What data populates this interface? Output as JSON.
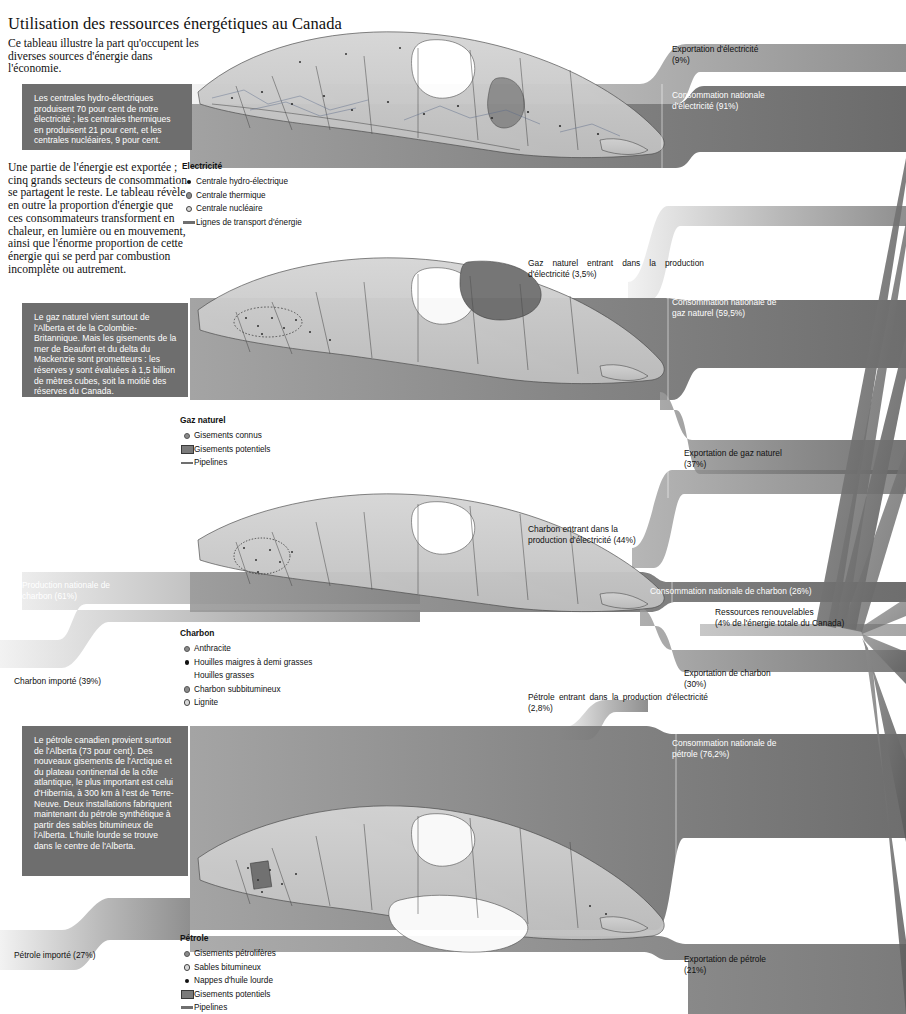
{
  "header": {
    "title": "Utilisation des ressources énergétiques au Canada",
    "intro": "Ce tableau illustre la part qu'occupent les diverses sources d'énergie dans l'économie.",
    "intro2": "Une partie de l'énergie est exportée ; cinq grands secteurs de consommation se partagent le reste. Le tableau révèle en outre la proportion d'énergie que ces consommateurs transforment en chaleur, en lumière ou en mouvement, ainsi que l'énorme proportion de cette énergie qui se perd par combustion incomplète ou autrement."
  },
  "notes": {
    "electricite": "Les centrales hydro-électriques produisent 70 pour cent de notre électricité ; les centrales thermiques en produisent 21 pour cent, et les centrales nucléaires, 9 pour cent.",
    "gaz": "Le gaz naturel vient surtout de l'Alberta et de la Colombie-Britannique. Mais les gisements de la mer de Beaufort et du delta du Mackenzie sont prometteurs : les réserves y sont évaluées à 1,5 billion de mètres cubes, soit la moitié des réserves du Canada.",
    "petrole": "Le pétrole canadien provient surtout de l'Alberta (73 pour cent). Des nouveaux gisements de l'Arctique et du plateau continental de la côte atlantique, le plus important est celui d'Hibernia, à 300 km à l'est de Terre-Neuve. Deux installations fabriquent maintenant du pétrole synthétique à partir des sables bitumineux de l'Alberta. L'huile lourde se trouve dans le centre de l'Alberta."
  },
  "legends": [
    {
      "key": "electricite",
      "title": "Electricité",
      "items": [
        {
          "marker": "dot-solid",
          "label": "Centrale hydro-électrique"
        },
        {
          "marker": "dot-mid",
          "label": "Centrale thermique"
        },
        {
          "marker": "dot-open",
          "label": "Centrale nucléaire"
        },
        {
          "marker": "line",
          "label": "Lignes de transport d'énergie"
        }
      ]
    },
    {
      "key": "gaz-naturel",
      "title": "Gaz naturel",
      "items": [
        {
          "marker": "dot-mid",
          "label": "Gisements connus"
        },
        {
          "marker": "swatch",
          "label": "Gisements potentiels"
        },
        {
          "marker": "line",
          "label": "Pipelines"
        }
      ]
    },
    {
      "key": "charbon",
      "title": "Charbon",
      "items": [
        {
          "marker": "dot-mid",
          "label": "Anthracite"
        },
        {
          "marker": "dot-solid",
          "label": "Houilles maigres à demi grasses"
        },
        {
          "marker": "none",
          "label": "Houilles grasses"
        },
        {
          "marker": "dot-mid",
          "label": "Charbon subbitumineux"
        },
        {
          "marker": "dot-open",
          "label": "Lignite"
        }
      ]
    },
    {
      "key": "petrole",
      "title": "Pétrole",
      "items": [
        {
          "marker": "dot-mid",
          "label": "Gisements pétrolifères"
        },
        {
          "marker": "dot-open",
          "label": "Sables bitumineux"
        },
        {
          "marker": "dot-solid",
          "label": "Nappes d'huile lourde"
        },
        {
          "marker": "swatch",
          "label": "Gisements potentiels"
        },
        {
          "marker": "line",
          "label": "Pipelines"
        }
      ]
    }
  ],
  "flows": {
    "exportation_electricite": "Exportation d'électricité\n(9%)",
    "consommation_electricite": "Consommation nationale\nd'électricité (91%)",
    "gaz_vers_electricite": "Gaz naturel entrant dans la production d'électricité (3,5%)",
    "consommation_gaz": "Consommation nationale de\ngaz naturel (59,5%)",
    "exportation_gaz": "Exportation de gaz naturel\n(37%)",
    "charbon_vers_electricite": "Charbon entrant dans la\nproduction d'électricité (44%)",
    "production_charbon": "Production nationale de\ncharbon (61%)",
    "consommation_charbon": "Consommation nationale de charbon (26%)",
    "ressources_renouvelables": "Ressources renouvelables\n(4% de l'énergie totale du Canada)",
    "charbon_importe": "Charbon importé (39%)",
    "exportation_charbon": "Exportation de charbon\n(30%)",
    "petrole_vers_electricite": "Pétrole entrant dans la production d'électricité (2,8%)",
    "consommation_petrole": "Consommation nationale de\npétrole (76,2%)",
    "petrole_importe": "Pétrole importé (27%)",
    "exportation_petrole": "Exportation de pétrole\n(21%)"
  },
  "chart_data": {
    "type": "sankey",
    "title": "Utilisation des ressources énergétiques au Canada",
    "units": "percent",
    "nodes": [
      "Électricité",
      "Gaz naturel",
      "Charbon",
      "Pétrole",
      "Consommation nationale",
      "Exportation",
      "Ressources renouvelables"
    ],
    "links": [
      {
        "source": "Électricité",
        "target": "Exportation",
        "value": 9,
        "label": "Exportation d'électricité (9%)"
      },
      {
        "source": "Électricité",
        "target": "Consommation nationale",
        "value": 91,
        "label": "Consommation nationale d'électricité (91%)"
      },
      {
        "source": "Gaz naturel",
        "target": "Électricité",
        "value": 3.5,
        "label": "Gaz naturel entrant dans la production d'électricité (3,5%)"
      },
      {
        "source": "Gaz naturel",
        "target": "Consommation nationale",
        "value": 59.5,
        "label": "Consommation nationale de gaz naturel (59,5%)"
      },
      {
        "source": "Gaz naturel",
        "target": "Exportation",
        "value": 37,
        "label": "Exportation de gaz naturel (37%)"
      },
      {
        "source": "Charbon",
        "target": "Électricité",
        "value": 44,
        "label": "Charbon entrant dans la production d'électricité (44%)"
      },
      {
        "source": "Production nationale",
        "target": "Charbon",
        "value": 61,
        "label": "Production nationale de charbon (61%)"
      },
      {
        "source": "Importation",
        "target": "Charbon",
        "value": 39,
        "label": "Charbon importé (39%)"
      },
      {
        "source": "Charbon",
        "target": "Consommation nationale",
        "value": 26,
        "label": "Consommation nationale de charbon (26%)"
      },
      {
        "source": "Charbon",
        "target": "Exportation",
        "value": 30,
        "label": "Exportation de charbon (30%)"
      },
      {
        "source": "Pétrole",
        "target": "Électricité",
        "value": 2.8,
        "label": "Pétrole entrant dans la production d'électricité (2,8%)"
      },
      {
        "source": "Pétrole",
        "target": "Consommation nationale",
        "value": 76.2,
        "label": "Consommation nationale de pétrole (76,2%)"
      },
      {
        "source": "Pétrole",
        "target": "Exportation",
        "value": 21,
        "label": "Exportation de pétrole (21%)"
      },
      {
        "source": "Importation",
        "target": "Pétrole",
        "value": 27,
        "label": "Pétrole importé (27%)"
      },
      {
        "source": "Ressources renouvelables",
        "target": "Consommation nationale",
        "value": 4,
        "label": "Ressources renouvelables (4% de l'énergie totale du Canada)"
      }
    ],
    "sources_detail": {
      "electricite_production": [
        {
          "name": "Centrales hydro-électriques",
          "value": 70
        },
        {
          "name": "Centrales thermiques",
          "value": 21
        },
        {
          "name": "Centrales nucléaires",
          "value": 9
        }
      ],
      "petrole_origine": [
        {
          "name": "Alberta",
          "value": 73
        }
      ]
    }
  },
  "colors": {
    "ribbon_dark": "#6e6e6e",
    "ribbon_mid": "#9a9a9a",
    "ribbon_light": "#c9c9c9",
    "map_fill": "#c9c9c9",
    "map_dark": "#8b8b8b",
    "note_bg": "#6e6e6e",
    "text": "#111111"
  }
}
